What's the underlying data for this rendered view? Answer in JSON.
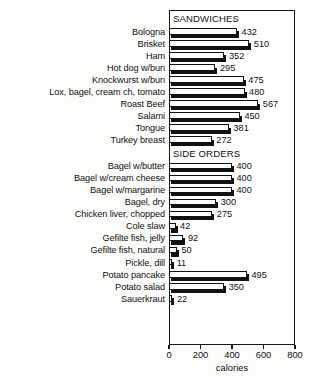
{
  "chart_data": {
    "type": "bar",
    "orientation": "horizontal",
    "title": "",
    "xlabel": "calories",
    "ylabel": "",
    "xlim": [
      0,
      800
    ],
    "xticks": [
      0,
      200,
      400,
      600,
      800
    ],
    "grid": false,
    "legend": null,
    "sections": [
      {
        "name": "SANDWICHES",
        "categories": [
          "Bologna",
          "Brisket",
          "Ham",
          "Hot dog w/bun",
          "Knockwurst w/bun",
          "Lox, bagel, cream ch, tomato",
          "Roast Beef",
          "Salami",
          "Tongue",
          "Turkey breast"
        ],
        "values": [
          432,
          510,
          352,
          295,
          475,
          480,
          567,
          450,
          381,
          272
        ]
      },
      {
        "name": "SIDE ORDERS",
        "categories": [
          "Bagel w/butter",
          "Bagel w/cream cheese",
          "Bagel w/margarine",
          "Bagel, dry",
          "Chicken liver, chopped",
          "Cole slaw",
          "Gefilte fish, jelly",
          "Gefilte fish, natural",
          "Pickle, dill",
          "Potato pancake",
          "Potato salad",
          "Sauerkraut"
        ],
        "values": [
          400,
          400,
          400,
          300,
          275,
          42,
          92,
          50,
          11,
          495,
          350,
          22
        ]
      }
    ],
    "colors": {
      "bar_face": "#ffffff",
      "bar_outline": "#111111",
      "bar_shadow": "#111111",
      "text": "#111111",
      "background": "#fdfdfb"
    }
  }
}
